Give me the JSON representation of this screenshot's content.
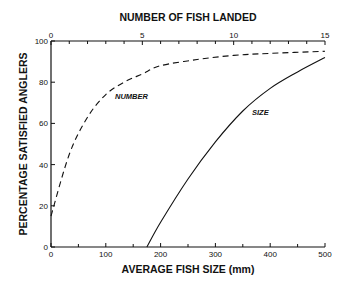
{
  "chart_data": {
    "type": "line",
    "title": "",
    "xlabel": "AVERAGE FISH SIZE (mm)",
    "x2label": "NUMBER OF FISH LANDED",
    "ylabel": "PERCENTAGE SATISFIED ANGLERS",
    "xlim": [
      0,
      500
    ],
    "x2lim": [
      0,
      15
    ],
    "ylim": [
      0,
      100
    ],
    "xticks": [
      "0",
      "100",
      "200",
      "300",
      "400",
      "500"
    ],
    "x2ticks": [
      "0",
      "5",
      "10",
      "15"
    ],
    "yticks": [
      "0",
      "20",
      "40",
      "60",
      "80",
      "100"
    ],
    "grid": false,
    "series": [
      {
        "name": "NUMBER",
        "axis": "top",
        "style": "dashed",
        "x": [
          0,
          1,
          2,
          3,
          4,
          5,
          6,
          8,
          10,
          12,
          15
        ],
        "y": [
          15,
          45,
          63,
          74,
          80,
          84,
          88,
          91,
          93,
          94,
          95
        ]
      },
      {
        "name": "SIZE",
        "axis": "bottom",
        "style": "solid",
        "x": [
          175,
          200,
          250,
          300,
          350,
          400,
          450,
          500
        ],
        "y": [
          0,
          12,
          33,
          51,
          66,
          77,
          85,
          92
        ]
      }
    ]
  }
}
